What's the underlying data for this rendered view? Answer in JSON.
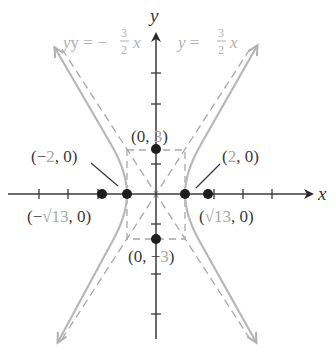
{
  "figure": {
    "type": "hyperbola",
    "equation_implied": "x^2/4 - y^2/9 = 1",
    "axes": {
      "x_label": "x",
      "y_label": "y"
    },
    "asymptotes": [
      {
        "id": "pos",
        "label_prefix": "y = ",
        "num": "3",
        "den": "2",
        "var": "x"
      },
      {
        "id": "neg",
        "label_prefix": "y = −",
        "num": "3",
        "den": "2",
        "var": "x"
      }
    ],
    "points": [
      {
        "id": "vertex-left",
        "open": "(",
        "a": "−2",
        "sep": ", ",
        "b": "0",
        "close": ")",
        "gray": "a"
      },
      {
        "id": "vertex-right",
        "open": "(",
        "a": "2",
        "sep": ", ",
        "b": "0",
        "close": ")",
        "gray": "a"
      },
      {
        "id": "covertex-top",
        "open": "(",
        "a": "0",
        "sep": ", ",
        "b": "3",
        "close": ")",
        "gray": "b"
      },
      {
        "id": "covertex-bottom",
        "open": "(",
        "a": "0",
        "sep": ", −",
        "b": "3",
        "close": ")",
        "gray": "b"
      },
      {
        "id": "focus-left",
        "open": "(−",
        "a": "√13",
        "sep": ", ",
        "b": "0",
        "close": ")",
        "gray": "a"
      },
      {
        "id": "focus-right",
        "open": "(",
        "a": "√13",
        "sep": ", ",
        "b": "0",
        "close": ")",
        "gray": "a"
      }
    ],
    "colors": {
      "axis": "#3a3a3a",
      "curve": "#b8b8b8",
      "dashed": "#a0a0a0",
      "point": "#1e1e1e",
      "label_dark": "#3a3a3a",
      "label_gray": "#a8a8a8"
    }
  }
}
